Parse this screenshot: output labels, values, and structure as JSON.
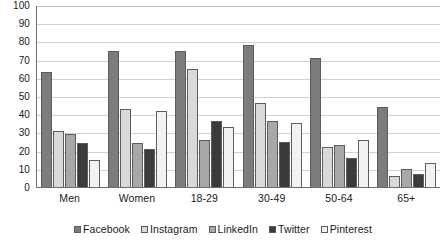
{
  "chart_data": {
    "type": "bar",
    "title": "",
    "subtitle": "",
    "xlabel": "",
    "ylabel": "",
    "ylim": [
      0,
      100
    ],
    "ytick_step": 10,
    "yticks": [
      100,
      90,
      80,
      70,
      60,
      50,
      40,
      30,
      20,
      10,
      0
    ],
    "grid": true,
    "orientation": "vertical",
    "grouping": "grouped",
    "legend_position": "bottom-center",
    "categories": [
      "Men",
      "Women",
      "18-29",
      "30-49",
      "50-64",
      "65+"
    ],
    "series": [
      {
        "name": "Facebook",
        "color": "#7c7c7c",
        "values": [
          63,
          75,
          75,
          78,
          71,
          44
        ]
      },
      {
        "name": "Instagram",
        "color": "#d9d9d9",
        "values": [
          31,
          43,
          65,
          46,
          22,
          6
        ]
      },
      {
        "name": "LinkedIn",
        "color": "#a8a8a8",
        "values": [
          29,
          24,
          26,
          36,
          23,
          10
        ]
      },
      {
        "name": "Twitter",
        "color": "#3b3b3b",
        "values": [
          24,
          21,
          36,
          25,
          16,
          7
        ]
      },
      {
        "name": "Pinterest",
        "color": "#f2f2f2",
        "values": [
          15,
          42,
          33,
          35,
          26,
          13
        ]
      }
    ]
  },
  "legend": {
    "items": [
      {
        "label": "Facebook",
        "swatch_name": "legend-swatch-facebook"
      },
      {
        "label": "Instagram",
        "swatch_name": "legend-swatch-instagram"
      },
      {
        "label": "LinkedIn",
        "swatch_name": "legend-swatch-linkedin"
      },
      {
        "label": "Twitter",
        "swatch_name": "legend-swatch-twitter"
      },
      {
        "label": "Pinterest",
        "swatch_name": "legend-swatch-pinterest"
      }
    ]
  },
  "axis_colors": {
    "axis_line": "#6e6e6e",
    "gridline": "#d2d2d2",
    "text": "#1a1a1a"
  }
}
